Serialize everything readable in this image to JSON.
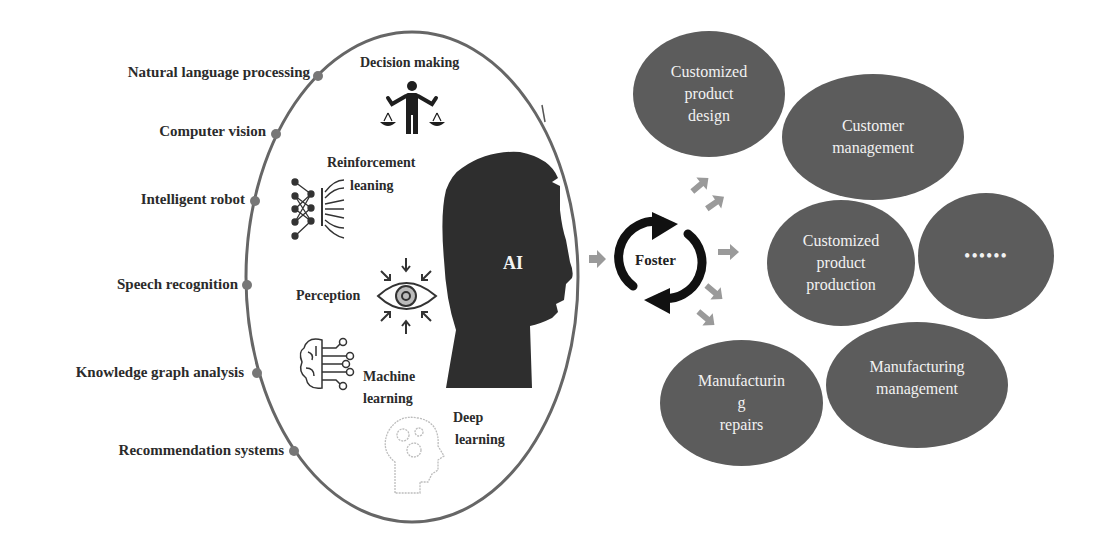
{
  "diagram": {
    "left_labels": [
      {
        "id": "nlp",
        "text": "Natural language processing"
      },
      {
        "id": "cv",
        "text": "Computer vision"
      },
      {
        "id": "robot",
        "text": "Intelligent robot"
      },
      {
        "id": "speech",
        "text": "Speech recognition"
      },
      {
        "id": "kg",
        "text": "Knowledge graph analysis"
      },
      {
        "id": "rec",
        "text": "Recommendation systems"
      }
    ],
    "inner_labels": {
      "decision": "Decision making",
      "reinforcement_1": "Reinforcement",
      "reinforcement_2": "leaning",
      "perception": "Perception",
      "ml_1": "Machine",
      "ml_2": "learning",
      "dl_1": "Deep",
      "dl_2": "learning"
    },
    "center": {
      "ai": "AI",
      "foster": "Foster"
    },
    "outcomes": [
      {
        "id": "design",
        "lines": [
          "Customized",
          "product",
          "design"
        ]
      },
      {
        "id": "customer",
        "lines": [
          "Customer",
          "management"
        ]
      },
      {
        "id": "production",
        "lines": [
          "Customized",
          "product",
          "production"
        ]
      },
      {
        "id": "more",
        "lines": [
          "••••••"
        ]
      },
      {
        "id": "repairs",
        "lines": [
          "Manufacturin",
          "g",
          "repairs"
        ]
      },
      {
        "id": "manufacturing",
        "lines": [
          "Manufacturing",
          "management"
        ]
      }
    ],
    "icons": {
      "decision": "balance-scale-person-icon",
      "reinforcement": "neural-network-icon",
      "perception": "eye-icon",
      "machine_learning": "brain-circuit-icon",
      "deep_learning": "head-gears-icon",
      "ai": "human-head-silhouette-icon",
      "foster": "cycle-arrows-icon"
    },
    "colors": {
      "ellipse_stroke": "#666666",
      "oval_fill": "#5c5c5c",
      "arrow_fill": "#9a9a9a",
      "head_fill": "#2e2e2e",
      "text": "#2b2b2b"
    }
  }
}
